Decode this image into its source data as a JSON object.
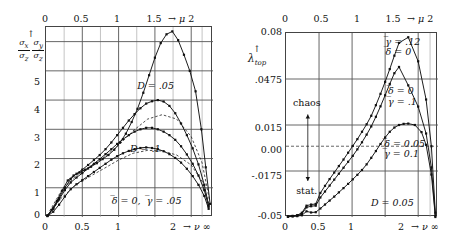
{
  "figure": {
    "panels": [
      "left",
      "right"
    ]
  },
  "left": {
    "id": "panel-sigma-ratios",
    "axes": {
      "x_top_label": "→ μ",
      "x_top_ticks": [
        "0",
        "0.5",
        "1",
        "1.5",
        "2"
      ],
      "x_bottom_label": "→ ν",
      "x_bottom_infinity": "∞",
      "x_bottom_ticks": [
        "0",
        "0.5",
        "1",
        "2"
      ],
      "y_ticks": [
        "0",
        "1",
        "2",
        "3",
        "4",
        "5"
      ],
      "y_label_num1": "σ",
      "y_label_sub_x": "x",
      "y_label_den1": "σ",
      "y_label_sub_z1": "z",
      "y_label_num2": "σ",
      "y_label_sub_y": "y",
      "y_label_den2": "σ",
      "y_label_sub_z2": "z",
      "y_label_arrow": "↑",
      "xlim": [
        0,
        2.3
      ],
      "ylim": [
        0,
        6.5
      ],
      "grid": true
    },
    "annotations": [
      {
        "name": "label-D-005",
        "text": "D = .05",
        "x": 1.27,
        "y": 4.45
      },
      {
        "name": "label-D-01",
        "text": "D = .1",
        "x": 1.17,
        "y": 2.3
      },
      {
        "name": "label-params",
        "text": "δ̄ = 0, γ̄ = .05",
        "x": 0.92,
        "y": 0.5
      }
    ]
  },
  "right": {
    "id": "panel-lyapunov",
    "axes": {
      "x_top_label": "→ μ",
      "x_top_ticks": [
        "0",
        "0.5",
        "1",
        "1.5",
        "2"
      ],
      "x_bottom_label": "→ ν",
      "x_bottom_infinity": "∞",
      "x_bottom_ticks": [
        "0",
        "0.5",
        "1",
        "2"
      ],
      "y_ticks": [
        "0.08",
        ".0475",
        "0.015",
        "0.00",
        "-.0175",
        "-0.05"
      ],
      "y_label_main": "λ",
      "y_label_sub": "top",
      "y_label_arrow": "↑",
      "xlim": [
        0,
        2.3
      ],
      "ylim": [
        -0.05,
        0.08
      ],
      "zero_line_dashed": true,
      "grid": true
    },
    "annotations": [
      {
        "name": "label-chaos",
        "text": "chaos",
        "x": 0.33,
        "y": 0.0295
      },
      {
        "name": "label-stat",
        "text": "stat.",
        "x": 0.33,
        "y": -0.0325
      },
      {
        "name": "label-params-top",
        "line1": "γ̄ = .12",
        "line2": "δ̄ = 0",
        "x": 1.52,
        "y": 0.0695
      },
      {
        "name": "label-params-mid",
        "line1": "δ̄ = 0",
        "line2": "γ̄ = .1",
        "x": 1.56,
        "y": 0.0345
      },
      {
        "name": "label-params-low",
        "line1": "δ̄ = 0.05",
        "line2": "γ̄ = 0.1",
        "x": 1.5,
        "y": -0.0025
      },
      {
        "name": "label-D",
        "text": "D = 0.05",
        "x": 1.3,
        "y": -0.0405
      }
    ]
  },
  "chart_data": [
    {
      "type": "line",
      "name": "left-panel",
      "title": "",
      "xlabel": "→ ν  ∞   /   → μ (top)",
      "ylabel": "σx/σz , σy/σz",
      "xlim": [
        0,
        2.3
      ],
      "ylim": [
        0,
        6.5
      ],
      "grid": true,
      "x_top_ticks": [
        0,
        0.5,
        1,
        1.5,
        2
      ],
      "x_bottom_ticks": [
        0,
        0.5,
        1,
        2
      ],
      "y_ticks": [
        0,
        1,
        2,
        3,
        4,
        5
      ],
      "annotations": [
        "D = .05",
        "D = .1",
        "δ̄ = 0, γ̄ = .05"
      ],
      "series": [
        {
          "name": "D=.05 sigma_x/sigma_z (tall peak)",
          "style": "solid-markers",
          "x": [
            0.02,
            0.08,
            0.15,
            0.22,
            0.3,
            0.38,
            0.46,
            0.54,
            0.62,
            0.7,
            0.78,
            0.86,
            0.94,
            1.02,
            1.1,
            1.18,
            1.26,
            1.34,
            1.42,
            1.5,
            1.58,
            1.66,
            1.74,
            1.82,
            1.9,
            1.98,
            2.06,
            2.14,
            2.2,
            2.26
          ],
          "y": [
            0.05,
            0.25,
            0.55,
            0.9,
            1.25,
            1.42,
            1.52,
            1.62,
            1.72,
            1.84,
            1.98,
            2.12,
            2.3,
            2.55,
            2.85,
            3.25,
            3.7,
            4.25,
            4.85,
            5.45,
            5.95,
            6.25,
            6.35,
            6.05,
            5.55,
            5.0,
            4.3,
            3.0,
            1.7,
            0.45
          ]
        },
        {
          "name": "D=.05 sigma_y/sigma_z",
          "style": "solid-markers",
          "x": [
            0.02,
            0.1,
            0.18,
            0.26,
            0.34,
            0.42,
            0.5,
            0.58,
            0.66,
            0.74,
            0.82,
            0.9,
            0.98,
            1.06,
            1.14,
            1.22,
            1.3,
            1.38,
            1.46,
            1.54,
            1.62,
            1.7,
            1.78,
            1.86,
            1.94,
            2.02,
            2.1,
            2.18,
            2.24
          ],
          "y": [
            0.05,
            0.3,
            0.65,
            1.0,
            1.3,
            1.48,
            1.62,
            1.78,
            1.95,
            2.12,
            2.32,
            2.55,
            2.8,
            3.05,
            3.3,
            3.52,
            3.72,
            3.88,
            3.96,
            4.0,
            3.95,
            3.8,
            3.55,
            3.2,
            2.8,
            2.35,
            1.8,
            1.1,
            0.4
          ]
        },
        {
          "name": "D=.1 sigma_x/sigma_z",
          "style": "solid-markers",
          "x": [
            0.02,
            0.1,
            0.18,
            0.26,
            0.34,
            0.42,
            0.5,
            0.58,
            0.66,
            0.74,
            0.82,
            0.9,
            0.98,
            1.06,
            1.14,
            1.22,
            1.3,
            1.38,
            1.46,
            1.54,
            1.62,
            1.7,
            1.78,
            1.86,
            1.94,
            2.02,
            2.1,
            2.18,
            2.24
          ],
          "y": [
            0.05,
            0.28,
            0.6,
            0.92,
            1.18,
            1.35,
            1.5,
            1.66,
            1.82,
            1.98,
            2.15,
            2.32,
            2.5,
            2.66,
            2.8,
            2.92,
            3.0,
            3.05,
            3.05,
            3.0,
            2.92,
            2.8,
            2.64,
            2.42,
            2.14,
            1.82,
            1.42,
            0.92,
            0.35
          ]
        },
        {
          "name": "D=.1 sigma_y/sigma_z",
          "style": "solid-markers",
          "x": [
            0.02,
            0.1,
            0.18,
            0.26,
            0.34,
            0.42,
            0.5,
            0.58,
            0.66,
            0.74,
            0.82,
            0.9,
            0.98,
            1.06,
            1.14,
            1.22,
            1.3,
            1.38,
            1.46,
            1.54,
            1.62,
            1.7,
            1.78,
            1.86,
            1.94,
            2.02,
            2.1,
            2.18,
            2.24
          ],
          "y": [
            0.03,
            0.18,
            0.42,
            0.7,
            0.95,
            1.12,
            1.26,
            1.4,
            1.54,
            1.68,
            1.82,
            1.96,
            2.08,
            2.18,
            2.26,
            2.32,
            2.36,
            2.38,
            2.36,
            2.32,
            2.25,
            2.15,
            2.02,
            1.86,
            1.65,
            1.4,
            1.1,
            0.72,
            0.28
          ]
        },
        {
          "name": "theory-dashed-upper",
          "style": "dashed",
          "x": [
            0.05,
            0.2,
            0.4,
            0.6,
            0.8,
            1.0,
            1.2,
            1.4,
            1.6,
            1.8,
            2.0,
            2.15,
            2.25
          ],
          "y": [
            0.2,
            0.85,
            1.38,
            1.72,
            2.05,
            2.45,
            2.95,
            3.35,
            3.5,
            3.35,
            2.75,
            1.85,
            0.6
          ]
        },
        {
          "name": "theory-dashed-lower",
          "style": "dashed",
          "x": [
            0.05,
            0.2,
            0.4,
            0.6,
            0.8,
            1.0,
            1.2,
            1.4,
            1.6,
            1.8,
            2.0,
            2.15,
            2.25
          ],
          "y": [
            0.12,
            0.62,
            1.08,
            1.38,
            1.66,
            1.95,
            2.18,
            2.28,
            2.26,
            2.12,
            1.78,
            1.22,
            0.4
          ]
        }
      ]
    },
    {
      "type": "line",
      "name": "right-panel",
      "title": "",
      "xlabel": "→ ν  ∞   /   → μ (top)",
      "ylabel": "λ_top",
      "xlim": [
        0,
        2.3
      ],
      "ylim": [
        -0.05,
        0.08
      ],
      "grid": true,
      "x_top_ticks": [
        0,
        0.5,
        1,
        1.5,
        2
      ],
      "x_bottom_ticks": [
        0,
        0.5,
        1,
        2
      ],
      "y_ticks": [
        0.08,
        0.0475,
        0.015,
        0.0,
        -0.0175,
        -0.05
      ],
      "zero_line_dashed": true,
      "annotations": [
        "chaos",
        "stat.",
        "γ̄ = .12 / δ̄ = 0",
        "δ̄ = 0 / γ̄ = .1",
        "δ̄ = 0.05 / γ̄ = 0.1",
        "D = 0.05"
      ],
      "series": [
        {
          "name": "gamma=.12 delta=0",
          "style": "solid-markers",
          "x": [
            0.03,
            0.1,
            0.17,
            0.24,
            0.31,
            0.38,
            0.45,
            0.52,
            0.59,
            0.66,
            0.73,
            0.8,
            0.87,
            0.94,
            1.01,
            1.08,
            1.15,
            1.22,
            1.29,
            1.36,
            1.43,
            1.5,
            1.57,
            1.64,
            1.71,
            1.85,
            2.0,
            2.12,
            2.2,
            2.26
          ],
          "y": [
            -0.0495,
            -0.0492,
            -0.0487,
            -0.047,
            -0.042,
            -0.0412,
            -0.0408,
            -0.033,
            -0.028,
            -0.0232,
            -0.0186,
            -0.014,
            -0.0094,
            -0.0046,
            0.0002,
            0.005,
            0.0102,
            0.0155,
            0.0215,
            0.029,
            0.037,
            0.0455,
            0.0545,
            0.064,
            0.073,
            0.077,
            0.06,
            0.033,
            0.0,
            -0.047
          ]
        },
        {
          "name": "delta=0 gamma=.1",
          "style": "solid-markers",
          "x": [
            0.03,
            0.1,
            0.17,
            0.24,
            0.31,
            0.38,
            0.45,
            0.52,
            0.59,
            0.66,
            0.73,
            0.8,
            0.87,
            0.94,
            1.01,
            1.08,
            1.15,
            1.22,
            1.29,
            1.36,
            1.43,
            1.5,
            1.57,
            1.64,
            1.71,
            1.85,
            2.0,
            2.12,
            2.2,
            2.26
          ],
          "y": [
            -0.0497,
            -0.0494,
            -0.049,
            -0.0478,
            -0.0432,
            -0.0424,
            -0.042,
            -0.0362,
            -0.032,
            -0.0278,
            -0.0236,
            -0.0194,
            -0.0152,
            -0.011,
            -0.0068,
            -0.0022,
            0.0028,
            0.0082,
            0.014,
            0.0208,
            0.0282,
            0.036,
            0.044,
            0.0516,
            0.056,
            0.043,
            0.028,
            0.009,
            -0.015,
            -0.049
          ]
        },
        {
          "name": "delta=0.05 gamma=0.1",
          "style": "solid-markers",
          "x": [
            0.03,
            0.1,
            0.17,
            0.24,
            0.31,
            0.38,
            0.45,
            0.52,
            0.59,
            0.66,
            0.73,
            0.8,
            0.87,
            0.94,
            1.01,
            1.08,
            1.15,
            1.22,
            1.29,
            1.36,
            1.43,
            1.5,
            1.57,
            1.64,
            1.71,
            1.78,
            1.85,
            1.95,
            2.05,
            2.12,
            2.2,
            2.26
          ],
          "y": [
            -0.0498,
            -0.0496,
            -0.0494,
            -0.0488,
            -0.046,
            -0.0468,
            -0.0466,
            -0.044,
            -0.0412,
            -0.0384,
            -0.0356,
            -0.0326,
            -0.0296,
            -0.0266,
            -0.0234,
            -0.0202,
            -0.0168,
            -0.0128,
            -0.0082,
            -0.0034,
            0.0016,
            0.0062,
            0.0102,
            0.0132,
            0.015,
            0.0158,
            0.016,
            0.015,
            0.01,
            0.001,
            -0.02,
            -0.05
          ]
        }
      ]
    }
  ]
}
